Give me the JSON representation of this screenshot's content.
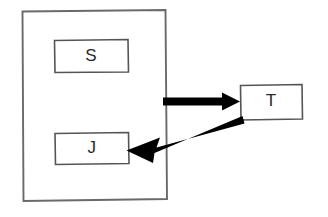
{
  "diagram": {
    "background_color": "#ffffff",
    "container": {
      "name": "outer-container",
      "label": "",
      "stroke_color": "#6a6a6a"
    },
    "nodes": [
      {
        "id": "s",
        "label": "S",
        "x": 55,
        "y": 40,
        "width": 73,
        "height": 32,
        "inside_container": true,
        "stroke_color": "#555555",
        "fill_color": "#ffffff"
      },
      {
        "id": "j",
        "label": "J",
        "x": 55,
        "y": 133,
        "width": 73,
        "height": 31,
        "inside_container": true,
        "stroke_color": "#555555",
        "fill_color": "#ffffff"
      },
      {
        "id": "t",
        "label": "T",
        "x": 240,
        "y": 85,
        "width": 62,
        "height": 35,
        "inside_container": false,
        "stroke_color": "#555555",
        "fill_color": "#ffffff"
      }
    ],
    "edges": [
      {
        "id": "edge-container-to-t",
        "from": "container",
        "to": "t",
        "label": "",
        "direction": "right",
        "color": "#000000",
        "style": "solid-thick"
      },
      {
        "id": "edge-t-to-j",
        "from": "t",
        "to": "j",
        "label": "",
        "direction": "down-left",
        "color": "#000000",
        "style": "solid-thick"
      }
    ]
  }
}
